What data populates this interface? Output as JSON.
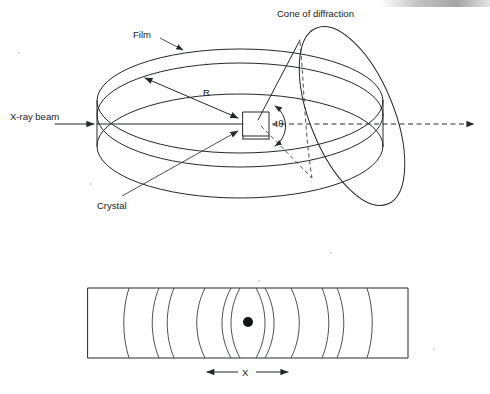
{
  "figure": {
    "labels": {
      "film": "Film",
      "cone": "Cone of diffraction",
      "beam": "X-ray beam",
      "radius": "R",
      "angle": "4θ",
      "crystal": "Crystal",
      "strip_dimension": "X"
    },
    "colors": {
      "ink": "#25282b",
      "background": "#ffffff",
      "spot": "#111315"
    }
  },
  "top_diagram": {
    "name": "camera-perspective-view",
    "film_cylinder": {
      "center_x": 240,
      "center_y": 124,
      "radius_x": 143,
      "radius_y": 52,
      "band_height": 45,
      "inner_offset": 14
    },
    "crystal": {
      "x": 243,
      "y": 112,
      "width": 26,
      "height": 26
    },
    "beam_axis": {
      "entry_x": 55,
      "exit_x": 478,
      "y": 124
    },
    "cone": {
      "apex_x": 256,
      "apex_y": 124,
      "tilt_deg": -22,
      "base_center_x": 352,
      "base_center_y": 116,
      "base_rx": 42,
      "base_ry": 95
    }
  },
  "bottom_diagram": {
    "name": "unrolled-film-strip",
    "strip": {
      "x": 88,
      "y": 288,
      "width": 320,
      "height": 70
    },
    "center_spot": {
      "x": 248,
      "y": 322,
      "radius": 5
    },
    "arc_offsets": [
      14,
      40,
      50,
      78,
      104,
      112
    ],
    "dimension_line": {
      "y": 372,
      "left_x": 205,
      "right_x": 290
    }
  }
}
